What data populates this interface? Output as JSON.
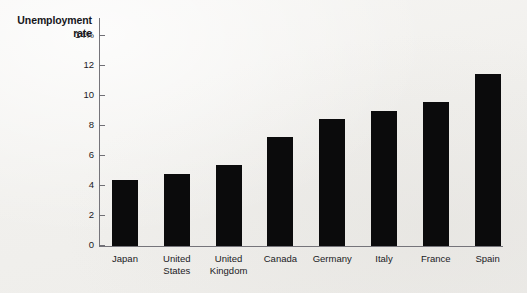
{
  "chart_data": {
    "type": "bar",
    "title": "Unemployment rate",
    "title_lines": [
      "Unemployment",
      "rate"
    ],
    "xlabel": "",
    "ylabel": "Unemployment rate",
    "categories": [
      "Japan",
      "United States",
      "United Kingdom",
      "Canada",
      "Germany",
      "Italy",
      "France",
      "Spain"
    ],
    "category_lines": [
      [
        "Japan"
      ],
      [
        "United",
        "States"
      ],
      [
        "United",
        "Kingdom"
      ],
      [
        "Canada"
      ],
      [
        "Germany"
      ],
      [
        "Italy"
      ],
      [
        "France"
      ],
      [
        "Spain"
      ]
    ],
    "values": [
      4.4,
      4.8,
      5.4,
      7.3,
      8.5,
      9.0,
      9.6,
      11.5
    ],
    "unit": "%",
    "ylim": [
      0,
      14
    ],
    "yticks": [
      0,
      2,
      4,
      6,
      8,
      10,
      12,
      14
    ],
    "ytick_labels": [
      "0",
      "2",
      "4",
      "6",
      "8",
      "10",
      "12",
      "14%"
    ],
    "grid": false,
    "legend": false,
    "bar_color": "#0b0b0c",
    "axis_color": "#75747a",
    "background_color": "#f3f2f0"
  }
}
